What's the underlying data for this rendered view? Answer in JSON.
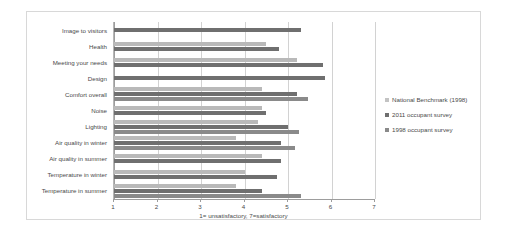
{
  "chart_data": {
    "type": "bar",
    "orientation": "horizontal",
    "title": "",
    "xlabel": "1= unsatisfactory,  7=satisfactory",
    "ylabel": "",
    "xlim": [
      1,
      7
    ],
    "xticks": [
      "1",
      "2",
      "3",
      "4",
      "5",
      "6",
      "7"
    ],
    "grid": true,
    "legend_position": "right",
    "categories": [
      "Image to visitors",
      "Health",
      "Meeting your needs",
      "Design",
      "Comfort overall",
      "Noise",
      "Lighting",
      "Air quality in winter",
      "Air quality in summer",
      "Temperature in winter",
      "Temperature in summer"
    ],
    "series": [
      {
        "name": "National Benchmark (1998)",
        "color": "#b9b9b9",
        "values": [
          null,
          4.5,
          5.2,
          null,
          4.4,
          4.4,
          4.3,
          3.8,
          4.4,
          4.0,
          3.8
        ]
      },
      {
        "name": "2011 occupant survey",
        "color": "#6f6f6f",
        "values": [
          5.3,
          4.8,
          5.8,
          5.85,
          5.2,
          4.5,
          5.0,
          4.85,
          4.85,
          4.75,
          4.4
        ]
      },
      {
        "name": "1998 occupant survey",
        "color": "#8a8a8a",
        "values": [
          null,
          null,
          null,
          null,
          5.45,
          null,
          5.25,
          5.15,
          null,
          null,
          5.3
        ]
      }
    ]
  },
  "legend": {
    "items": [
      {
        "label": "National Benchmark (1998)"
      },
      {
        "label": "2011 occupant survey"
      },
      {
        "label": "1998 occupant survey"
      }
    ]
  }
}
